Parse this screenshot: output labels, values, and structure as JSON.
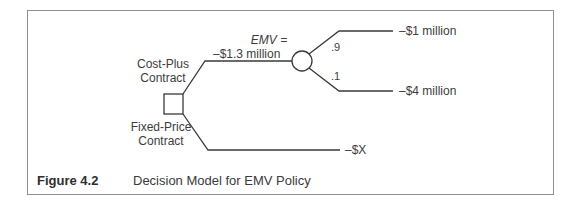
{
  "figure": {
    "number": "Figure 4.2",
    "caption": "Decision Model for EMV Policy"
  },
  "decision_node": {
    "shape": "square",
    "branches": [
      {
        "label_line1": "Cost-Plus",
        "label_line2": "Contract"
      },
      {
        "label_line1": "Fixed-Price",
        "label_line2": "Contract",
        "outcome": "–$X"
      }
    ]
  },
  "chance_node": {
    "shape": "circle",
    "emv_label": "EMV =",
    "emv_value": "–$1.3 million",
    "outcomes": [
      {
        "probability": ".9",
        "value": "–$1 million"
      },
      {
        "probability": ".1",
        "value": "–$4 million"
      }
    ]
  },
  "colors": {
    "line": "#3a3a3a",
    "frame": "#8f8f8f",
    "text": "#3a3a3a"
  }
}
